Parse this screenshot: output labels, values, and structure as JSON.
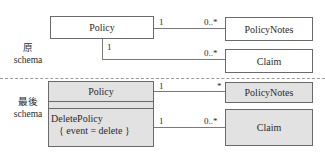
{
  "top": {
    "section_label_line1": "原",
    "section_label_line2": "schema",
    "policy": "Policy",
    "policy_notes": "PolicyNotes",
    "claim": "Claim",
    "assoc_notes": {
      "from": "1",
      "to": "0..*"
    },
    "assoc_claim": {
      "from": "1",
      "to": "0..*"
    }
  },
  "bottom": {
    "section_label_line1": "最後",
    "section_label_line2": "schema",
    "policy": "Policy",
    "delete_policy": "DeletePolicy",
    "event_constraint": "{ event = delete }",
    "policy_notes": "PolicyNotes",
    "claim": "Claim",
    "assoc_notes": {
      "from": "1",
      "to": "*"
    },
    "assoc_claim": {
      "from": "1",
      "to": "0..*"
    }
  },
  "colors": {
    "shade": "#e2e2e2",
    "border": "#6a6a6a"
  }
}
